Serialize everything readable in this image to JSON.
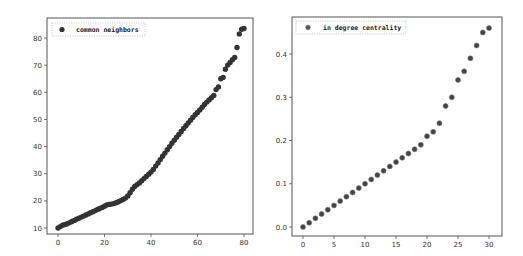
{
  "chart_data": [
    {
      "type": "scatter",
      "title": "",
      "xlabel": "",
      "ylabel": "",
      "legend": [
        "common neighbors"
      ],
      "legend_position": "upper left",
      "grid": false,
      "xlim": [
        -4,
        84
      ],
      "ylim": [
        6.5,
        86.5
      ],
      "xticks": [
        0,
        20,
        40,
        60,
        80
      ],
      "yticks": [
        10,
        20,
        30,
        40,
        50,
        60,
        70,
        80
      ],
      "marker_color": "#333333",
      "series": [
        {
          "name": "common neighbors",
          "x": [
            0,
            1,
            2,
            3,
            4,
            5,
            6,
            7,
            8,
            9,
            10,
            11,
            12,
            13,
            14,
            15,
            16,
            17,
            18,
            19,
            20,
            21,
            22,
            23,
            24,
            25,
            26,
            27,
            28,
            29,
            30,
            31,
            32,
            33,
            34,
            35,
            36,
            37,
            38,
            39,
            40,
            41,
            42,
            43,
            44,
            45,
            46,
            47,
            48,
            49,
            50,
            51,
            52,
            53,
            54,
            55,
            56,
            57,
            58,
            59,
            60,
            61,
            62,
            63,
            64,
            65,
            66,
            67,
            68,
            69,
            70,
            71,
            72,
            73,
            74,
            75,
            76,
            77,
            78,
            79,
            80
          ],
          "y": [
            10,
            10.5,
            11,
            11.3,
            11.6,
            12,
            12.4,
            12.8,
            13.2,
            13.6,
            14,
            14.4,
            14.8,
            15.2,
            15.6,
            16,
            16.4,
            16.8,
            17.2,
            17.6,
            18,
            18.5,
            18.7,
            18.8,
            19,
            19.3,
            19.7,
            20.1,
            20.5,
            21,
            21.8,
            23,
            24.3,
            25.3,
            26,
            26.6,
            27.4,
            28.2,
            29,
            29.8,
            30.6,
            31.6,
            32.8,
            34,
            35.2,
            36.4,
            37.6,
            38.8,
            40,
            41.2,
            42.3,
            43.4,
            44.5,
            45.6,
            46.7,
            47.7,
            48.7,
            49.7,
            50.7,
            51.7,
            52.6,
            53.5,
            54.5,
            55.5,
            56.4,
            57.2,
            58,
            58.8,
            61,
            62,
            65,
            65.5,
            68.5,
            70,
            71,
            72,
            72.8,
            76.5,
            81.5,
            83.2,
            83.5
          ]
        }
      ]
    },
    {
      "type": "scatter",
      "title": "",
      "xlabel": "",
      "ylabel": "",
      "legend": [
        "in degree centrality"
      ],
      "legend_position": "upper left",
      "grid": false,
      "xlim": [
        -1.5,
        31.5
      ],
      "ylim": [
        -0.023,
        0.483
      ],
      "xticks": [
        0,
        5,
        10,
        15,
        20,
        25,
        30
      ],
      "yticks": [
        0.0,
        0.1,
        0.2,
        0.3,
        0.4
      ],
      "marker_color": "#444444",
      "series": [
        {
          "name": "in degree centrality",
          "x": [
            0,
            1,
            2,
            3,
            4,
            5,
            6,
            7,
            8,
            9,
            10,
            11,
            12,
            13,
            14,
            15,
            16,
            17,
            18,
            19,
            20,
            21,
            22,
            23,
            24,
            25,
            26,
            27,
            28,
            29,
            30
          ],
          "y": [
            0.0,
            0.01,
            0.02,
            0.03,
            0.04,
            0.05,
            0.06,
            0.07,
            0.08,
            0.09,
            0.1,
            0.11,
            0.12,
            0.13,
            0.14,
            0.15,
            0.16,
            0.17,
            0.18,
            0.19,
            0.21,
            0.22,
            0.24,
            0.28,
            0.3,
            0.34,
            0.36,
            0.39,
            0.42,
            0.45,
            0.46
          ]
        }
      ]
    }
  ],
  "charts": [
    {
      "legend_label": "common neighbors",
      "xtick_labels": [
        "0",
        "20",
        "40",
        "60",
        "80"
      ],
      "ytick_labels": [
        "10",
        "20",
        "30",
        "40",
        "50",
        "60",
        "70",
        "80"
      ]
    },
    {
      "legend_label": "in degree centrality",
      "xtick_labels": [
        "0",
        "5",
        "10",
        "15",
        "20",
        "25",
        "30"
      ],
      "ytick_labels": [
        "0.0",
        "0.1",
        "0.2",
        "0.3",
        "0.4"
      ]
    }
  ]
}
